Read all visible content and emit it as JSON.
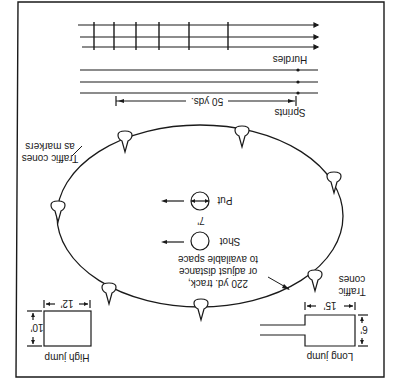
{
  "diagram": {
    "orientation": "rotated 180 degrees",
    "ink_color": "#1a1a1a",
    "background": "#ffffff",
    "labels": {
      "hurdles": "Hurdles",
      "sprints": "Sprints",
      "sprint_distance": "50 yds.",
      "cones_markers_line1": "Traffic cones",
      "cones_markers_line2": "as markers",
      "shot": "Shot",
      "put": "Put",
      "shot_diameter": "7'",
      "track_line1": "220 yd. track,",
      "track_line2": "or adjust distance",
      "track_line3": "to available space",
      "cones_line1": "Traffic",
      "cones_line2": "cones",
      "high_jump": "High jump",
      "high_jump_width": "12'",
      "high_jump_depth": "10'",
      "long_jump": "Long jump",
      "long_jump_width": "15'",
      "long_jump_depth": "6'"
    }
  }
}
